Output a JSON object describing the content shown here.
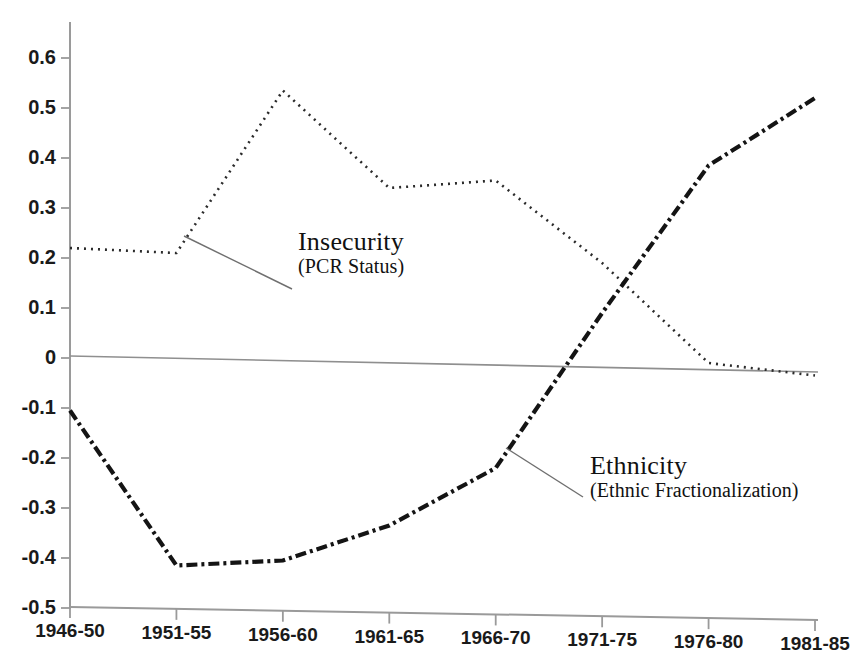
{
  "chart_data": {
    "type": "line",
    "title": "",
    "subtitle": "",
    "xlabel": "",
    "ylabel": "",
    "categories": [
      "1946-50",
      "1951-55",
      "1956-60",
      "1961-65",
      "1966-70",
      "1971-75",
      "1976-80",
      "1981-85"
    ],
    "ylim": [
      -0.5,
      0.65
    ],
    "ytick_labels": [
      "0.6",
      "0.5",
      "0.4",
      "0.3",
      "0.2",
      "0.1",
      "0",
      "-0.1",
      "-0.2",
      "-0.3",
      "-0.4",
      "-0.5"
    ],
    "ytick_values": [
      0.6,
      0.5,
      0.4,
      0.3,
      0.2,
      0.1,
      0,
      -0.1,
      -0.2,
      -0.3,
      -0.4,
      -0.5
    ],
    "grid": false,
    "legend_position": "inline-annotations",
    "series": [
      {
        "name": "Insecurity",
        "sublabel": "(PCR Status)",
        "style": "dotted",
        "color": "#2b2b2b",
        "values": [
          0.22,
          0.21,
          0.535,
          0.34,
          0.355,
          0.19,
          -0.01,
          -0.035
        ]
      },
      {
        "name": "Ethnicity",
        "sublabel": "(Ethnic Fractionalization)",
        "style": "dash-dot",
        "color": "#141414",
        "values": [
          -0.105,
          -0.415,
          -0.405,
          -0.335,
          -0.22,
          0.09,
          0.385,
          0.52
        ]
      }
    ],
    "annotations": [
      {
        "label": "Insecurity",
        "sublabel": "(PCR Status)",
        "target_series": "Insecurity"
      },
      {
        "label": "Ethnicity",
        "sublabel": "(Ethnic Fractionalization)",
        "target_series": "Ethnicity"
      }
    ],
    "zero_line": true,
    "axis_color": "#8a8a8a"
  }
}
